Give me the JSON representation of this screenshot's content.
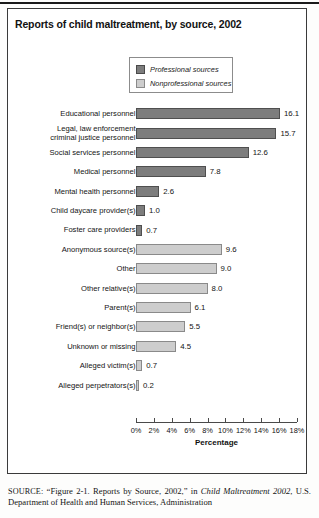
{
  "chart_title": "Reports of child maltreatment, by source, 2002",
  "legend": {
    "items": [
      {
        "label": "Professional sources",
        "color": "#7d7d7d",
        "key": "professional"
      },
      {
        "label": "Nonprofessional sources",
        "color": "#cdcdcd",
        "key": "nonprofessional"
      }
    ]
  },
  "axis": {
    "title": "Percentage",
    "ticks": [
      "0%",
      "2%",
      "4%",
      "6%",
      "8%",
      "10%",
      "12%",
      "14%",
      "16%",
      "18%"
    ],
    "min": 0,
    "max": 18
  },
  "source_note": {
    "prefix": "SOURCE:",
    "line": " “Figure 2-1. Reports by Source, 2002,” in ",
    "italic_title": "Child Maltreatment 2002",
    "tail": ", U.S. Department of Health and Human Services, Administration"
  },
  "chart_data": {
    "type": "bar",
    "orientation": "horizontal",
    "title": "Reports of child maltreatment, by source, 2002",
    "xlabel": "Percentage",
    "ylabel": "",
    "xlim": [
      0,
      18
    ],
    "grid": false,
    "legend_position": "top-center",
    "categories": [
      "Educational personnel",
      "Legal, law enforcement\ncriminal justice personnel",
      "Social services personnel",
      "Medical personnel",
      "Mental health personnel",
      "Child daycare provider(s)",
      "Foster care providers",
      "Anonymous source(s)",
      "Other",
      "Other relative(s)",
      "Parent(s)",
      "Friend(s) or neighbor(s)",
      "Unknown or missing",
      "Alleged victim(s)",
      "Alleged perpetrators(s)"
    ],
    "values": [
      16.1,
      15.7,
      12.6,
      7.8,
      2.6,
      1.0,
      0.7,
      9.6,
      9.0,
      8.0,
      6.1,
      5.5,
      4.5,
      0.7,
      0.2
    ],
    "value_labels": [
      "16.1",
      "15.7",
      "12.6",
      "7.8",
      "2.6",
      "1.0",
      "0.7",
      "9.6",
      "9.0",
      "8.0",
      "6.1",
      "5.5",
      "4.5",
      "0.7",
      "0.2"
    ],
    "series_group": [
      "professional",
      "professional",
      "professional",
      "professional",
      "professional",
      "professional",
      "professional",
      "nonprofessional",
      "nonprofessional",
      "nonprofessional",
      "nonprofessional",
      "nonprofessional",
      "nonprofessional",
      "nonprofessional",
      "nonprofessional"
    ]
  }
}
